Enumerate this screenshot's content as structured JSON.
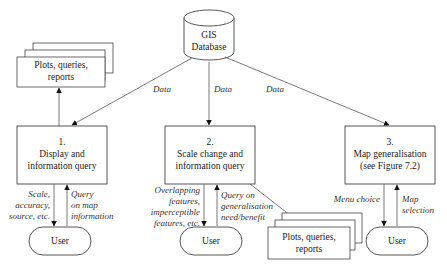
{
  "database": {
    "line1": "GIS",
    "line2": "Database"
  },
  "flows": {
    "data_left": "Data",
    "data_center": "Data",
    "data_right": "Data"
  },
  "processes": [
    {
      "number": "1.",
      "line1": "Display and",
      "line2": "information query"
    },
    {
      "number": "2.",
      "line1": "Scale change and",
      "line2": "information query"
    },
    {
      "number": "3.",
      "line1": "Map generalisation",
      "line2": "(see Figure 7.2)"
    }
  ],
  "outputs": {
    "top_left": {
      "line1": "Plots, queries,",
      "line2": "reports"
    },
    "bottom": {
      "line1": "Plots, queries,",
      "line2": "reports"
    }
  },
  "users": [
    "User",
    "User",
    "User"
  ],
  "interactions": {
    "p1_down": [
      "Scale,",
      "accuracy,",
      "source, etc."
    ],
    "p1_up": [
      "Query",
      "on map",
      "information"
    ],
    "p2_down": [
      "Overlapping",
      "features,",
      "imperceptible",
      "features, etc."
    ],
    "p2_up": [
      "Query on",
      "generalisation",
      "need/benefit"
    ],
    "p3_down": [
      "Menu choice"
    ],
    "p3_up": [
      "Map",
      "selection"
    ]
  }
}
